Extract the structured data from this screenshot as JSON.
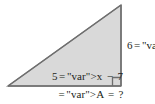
{
  "figure": {
    "type": "right-triangle",
    "background_color": "#ffffff",
    "fill_color": "#d9d9d9",
    "stroke_color": "#808080",
    "text_color": "#231f20",
    "geometry": {
      "apex": {
        "x": 121,
        "y": 5
      },
      "bottom_right": {
        "x": 121,
        "y": 86
      },
      "bottom_left": {
        "x": 8,
        "y": 86
      },
      "right_angle_vertex": "bottom_right",
      "right_angle_marker_size": 8
    }
  },
  "labels": {
    "vertical_leg": {
      "full_text": "6x − 4",
      "coefficient": "6",
      "variable": "x",
      "operator": "−",
      "constant": "4",
      "position": "right-of-vertical-leg"
    },
    "base_inner": {
      "full_text": "5x − 7",
      "coefficient": "5",
      "variable": "x",
      "operator": "−",
      "constant": "7",
      "position": "inside-above-base"
    },
    "area_question": {
      "full_text": "A = ?",
      "variable": "A",
      "operator": "=",
      "value": "?",
      "position": "below-base"
    }
  }
}
